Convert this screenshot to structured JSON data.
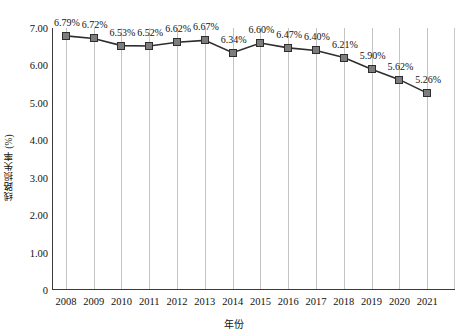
{
  "chart_data": {
    "type": "line",
    "title": "",
    "xlabel": "年份",
    "ylabel": "线路损失率 (%)",
    "categories": [
      "2008",
      "2009",
      "2010",
      "2011",
      "2012",
      "2013",
      "2014",
      "2015",
      "2016",
      "2017",
      "2018",
      "2019",
      "2020",
      "2021"
    ],
    "values": [
      6.79,
      6.72,
      6.53,
      6.52,
      6.62,
      6.67,
      6.34,
      6.6,
      6.47,
      6.4,
      6.21,
      5.9,
      5.62,
      5.26
    ],
    "point_labels": [
      "6.79%",
      "6.72%",
      "6.53%",
      "6.52%",
      "6.62%",
      "6.67%",
      "6.34%",
      "6.60%",
      "6.47%",
      "6.40%",
      "6.21%",
      "5.90%",
      "5.62%",
      "5.26%"
    ],
    "ylim": [
      0,
      7
    ],
    "ytick_values": [
      7,
      6,
      5,
      4,
      3,
      2,
      1,
      0
    ],
    "ytick_labels": [
      "7.00",
      "6.00",
      "5.00",
      "4.00",
      "3.00",
      "2.00",
      "1.00",
      "0"
    ],
    "grid": "vertical-only",
    "legend": "none",
    "series": [
      {
        "name": "线路损失率",
        "values": [
          6.79,
          6.72,
          6.53,
          6.52,
          6.62,
          6.67,
          6.34,
          6.6,
          6.47,
          6.4,
          6.21,
          5.9,
          5.62,
          5.26
        ]
      }
    ],
    "colors": {
      "line": "#2e2e2e",
      "marker_fill": "#7d7d7d",
      "marker_border": "#2e2e2e",
      "gridline": "#c4c4c4",
      "axis": "#3a3a3a",
      "text": "#111111",
      "background": "#ffffff"
    }
  }
}
